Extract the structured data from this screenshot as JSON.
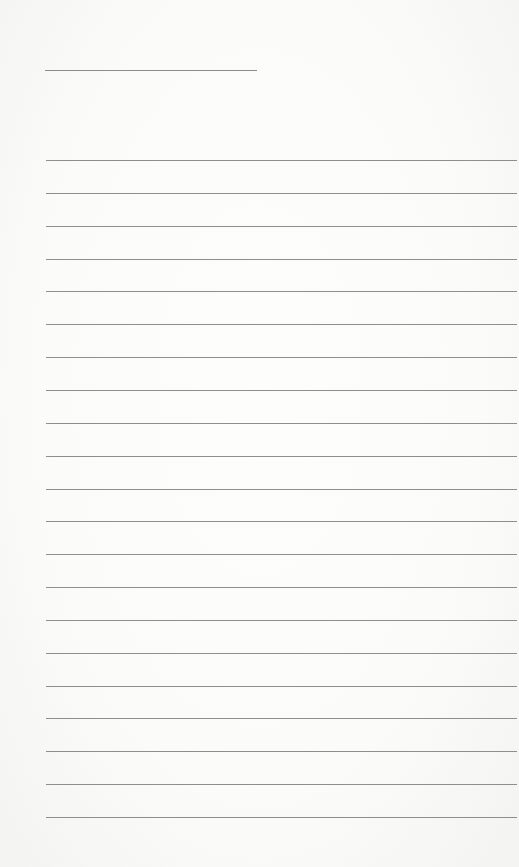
{
  "page": {
    "type": "lined-paper",
    "background_color": "#fafafa",
    "line_color": "#8e8e8e",
    "header_line": {
      "label": ""
    },
    "ruled_lines": [
      {
        "label": ""
      },
      {
        "label": ""
      },
      {
        "label": ""
      },
      {
        "label": ""
      },
      {
        "label": ""
      },
      {
        "label": ""
      },
      {
        "label": ""
      },
      {
        "label": ""
      },
      {
        "label": ""
      },
      {
        "label": ""
      },
      {
        "label": ""
      },
      {
        "label": ""
      },
      {
        "label": ""
      },
      {
        "label": ""
      },
      {
        "label": ""
      },
      {
        "label": ""
      },
      {
        "label": ""
      },
      {
        "label": ""
      },
      {
        "label": ""
      },
      {
        "label": ""
      },
      {
        "label": ""
      }
    ]
  }
}
